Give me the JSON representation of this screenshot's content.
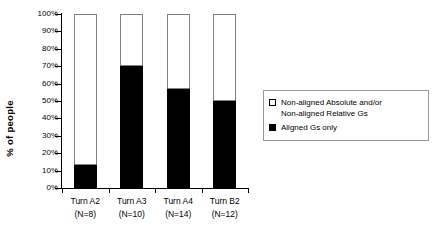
{
  "chart_data": {
    "type": "bar",
    "subtype": "stacked-100-percent",
    "title": "",
    "xlabel": "",
    "ylabel": "% of people",
    "ylim": [
      0,
      100
    ],
    "yticks": [
      "0%",
      "10%",
      "20%",
      "30%",
      "40%",
      "50%",
      "60%",
      "70%",
      "80%",
      "90%",
      "100%"
    ],
    "grid": false,
    "legend_position": "right",
    "categories": [
      "Turn A2",
      "Turn A3",
      "Turn A4",
      "Turn B2"
    ],
    "category_counts": [
      "(N=8)",
      "(N=10)",
      "(N=14)",
      "(N=12)"
    ],
    "series": [
      {
        "name": "Aligned Gs only",
        "color": "#000000",
        "values": [
          13,
          70,
          57,
          50
        ]
      },
      {
        "name": "Non-aligned Absolute and/or Non-aligned Relative Gs",
        "color": "#FFFFFF",
        "values": [
          87,
          30,
          43,
          50
        ]
      }
    ]
  },
  "axis": {
    "y_title": "% of people"
  },
  "legend": {
    "entries": [
      {
        "swatch": "open-square",
        "line1": "Non-aligned Absolute and/or",
        "line2": "Non-aligned Relative Gs"
      },
      {
        "swatch": "filled-square",
        "line1": "Aligned Gs only",
        "line2": ""
      }
    ]
  }
}
